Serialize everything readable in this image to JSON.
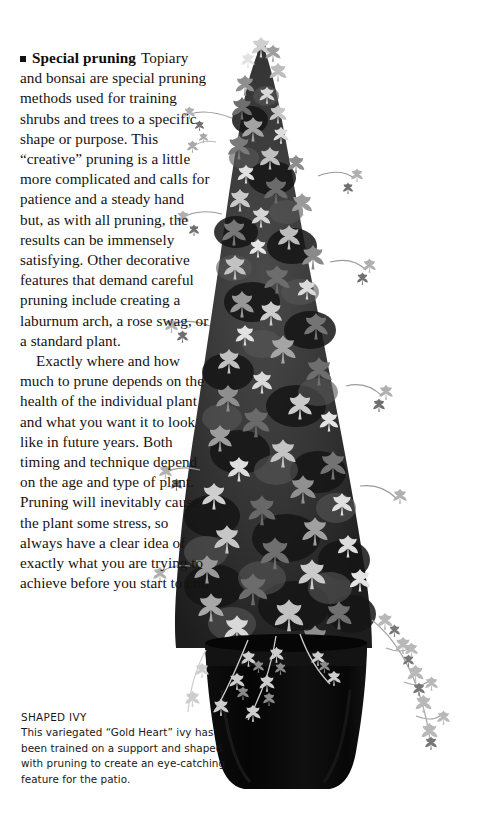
{
  "page": {
    "background_color": "#ffffff",
    "text_color": "#16120f"
  },
  "article": {
    "bullet_icon": "black-square-bullet",
    "run_in_heading": "Special pruning",
    "paragraphs": [
      "Topiary and bonsai are special pruning methods used for training shrubs and trees to a specific shape or purpose. This “creative” pruning is a little more complicated and calls for patience and a steady hand but, as with all pruning, the results can be immensely satisfying. Other decorative features that demand careful pruning include creating a laburnum arch, a rose swag, or a standard plant.",
      "Exactly where and how much to prune depends on the health of the individual plant and what you want it to look like in future years. Both timing and technique depend on the age and type of plant. Pruning will inevitably cause the plant some stress, so always have a clear idea of exactly what you are trying to achieve before you start to cut."
    ]
  },
  "caption": {
    "title": "SHAPED IVY",
    "body": "This variegated “Gold Heart” ivy has been trained on a support and shaped with pruning to create an eye-catching feature for the patio."
  },
  "photograph": {
    "subject": "shaped-ivy-topiary",
    "description": "Black and white photograph of a variegated ivy trained into a tall cone on a central support, growing in a dark tapered container",
    "palette": {
      "pot_dark": "#0a0a0a",
      "foliage_dark": "#2a2a2a",
      "foliage_mid": "#6b6b6b",
      "foliage_light": "#d6d6d6",
      "pole": "#b4b0a8",
      "background": "#ffffff"
    }
  }
}
